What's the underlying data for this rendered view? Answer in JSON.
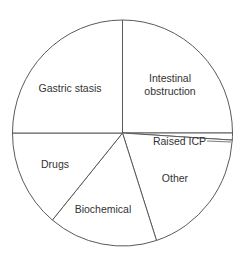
{
  "chart_data": {
    "type": "pie",
    "title": "",
    "start_angle": "12 o'clock",
    "direction": "clockwise",
    "slices": [
      {
        "label": "Intestinal obstruction",
        "label_lines": [
          "Intestinal",
          "obstruction"
        ],
        "value": 25
      },
      {
        "label": "Raised ICP",
        "label_lines": [
          "Raised ICP"
        ],
        "value": 1
      },
      {
        "label": "Other",
        "label_lines": [
          "Other"
        ],
        "value": 19
      },
      {
        "label": "Biochemical",
        "label_lines": [
          "Biochemical"
        ],
        "value": 16
      },
      {
        "label": "Drugs",
        "label_lines": [
          "Drugs"
        ],
        "value": 14
      },
      {
        "label": "Gastric stasis",
        "label_lines": [
          "Gastric stasis"
        ],
        "value": 25
      }
    ],
    "units": "percent (estimated from slice angles)",
    "legend": "none (labels inside slices)",
    "colors": {
      "fill": "#ffffff",
      "stroke": "#5a5a5a",
      "text": "#333333"
    }
  }
}
